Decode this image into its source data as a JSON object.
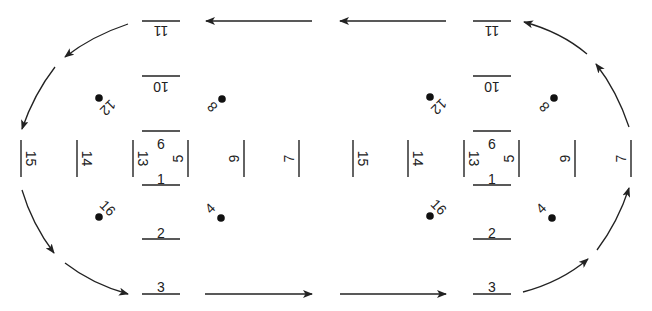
{
  "diagram": {
    "title": "",
    "colors": {
      "stroke": "#222222",
      "dot": "#111111",
      "background": "#ffffff"
    },
    "clusters": [
      {
        "id": "left",
        "cx": 161,
        "hlines": [
          {
            "label": "11",
            "x": 142,
            "y": 21,
            "w": 38,
            "label_y": 30,
            "flipped": true
          },
          {
            "label": "10",
            "x": 142,
            "y": 76,
            "w": 38,
            "label_y": 86,
            "flipped": true
          },
          {
            "label": "6",
            "x": 142,
            "y": 131,
            "w": 38,
            "label_y": 145,
            "flipped": false
          },
          {
            "label": "1",
            "x": 142,
            "y": 185,
            "w": 38,
            "label_y": 180,
            "flipped": false
          },
          {
            "label": "2",
            "x": 142,
            "y": 239,
            "w": 38,
            "label_y": 234,
            "flipped": false
          },
          {
            "label": "3",
            "x": 142,
            "y": 294,
            "w": 38,
            "label_y": 288,
            "flipped": false
          }
        ],
        "vlines": [
          {
            "label": "15",
            "x": 21,
            "y1": 140,
            "y2": 177,
            "side": "right"
          },
          {
            "label": "14",
            "x": 77,
            "y1": 140,
            "y2": 177,
            "side": "right"
          },
          {
            "label": "13",
            "x": 133,
            "y1": 140,
            "y2": 177,
            "side": "right"
          },
          {
            "label": "5",
            "x": 188,
            "y1": 140,
            "y2": 177,
            "side": "left"
          },
          {
            "label": "9",
            "x": 244,
            "y1": 140,
            "y2": 177,
            "side": "left"
          },
          {
            "label": "7",
            "x": 299,
            "y1": 140,
            "y2": 177,
            "side": "left"
          }
        ],
        "dots": [
          {
            "label": "12",
            "x": 99,
            "y": 98,
            "lx": 107,
            "ly": 107,
            "rot": 135
          },
          {
            "label": "8",
            "x": 222,
            "y": 99,
            "lx": 213,
            "ly": 106,
            "rot": 225
          },
          {
            "label": "16",
            "x": 99,
            "y": 217,
            "lx": 107,
            "ly": 209,
            "rot": 45
          },
          {
            "label": "4",
            "x": 221,
            "y": 218,
            "lx": 211,
            "ly": 209,
            "rot": -45
          }
        ]
      },
      {
        "id": "right",
        "cx": 492,
        "hlines": [
          {
            "label": "11",
            "x": 473,
            "y": 21,
            "w": 38,
            "label_y": 30,
            "flipped": true
          },
          {
            "label": "10",
            "x": 473,
            "y": 76,
            "w": 38,
            "label_y": 86,
            "flipped": true
          },
          {
            "label": "6",
            "x": 473,
            "y": 131,
            "w": 38,
            "label_y": 145,
            "flipped": false
          },
          {
            "label": "1",
            "x": 473,
            "y": 185,
            "w": 38,
            "label_y": 180,
            "flipped": false
          },
          {
            "label": "2",
            "x": 473,
            "y": 239,
            "w": 38,
            "label_y": 234,
            "flipped": false
          },
          {
            "label": "3",
            "x": 473,
            "y": 294,
            "w": 38,
            "label_y": 288,
            "flipped": false
          }
        ],
        "vlines": [
          {
            "label": "15",
            "x": 353,
            "y1": 140,
            "y2": 177,
            "side": "right"
          },
          {
            "label": "14",
            "x": 408,
            "y1": 140,
            "y2": 177,
            "side": "right"
          },
          {
            "label": "13",
            "x": 464,
            "y1": 140,
            "y2": 177,
            "side": "right"
          },
          {
            "label": "5",
            "x": 519,
            "y1": 140,
            "y2": 177,
            "side": "left"
          },
          {
            "label": "9",
            "x": 575,
            "y1": 140,
            "y2": 177,
            "side": "left"
          },
          {
            "label": "7",
            "x": 631,
            "y1": 140,
            "y2": 177,
            "side": "left"
          }
        ],
        "dots": [
          {
            "label": "12",
            "x": 430,
            "y": 97,
            "lx": 438,
            "ly": 106,
            "rot": 135
          },
          {
            "label": "8",
            "x": 554,
            "y": 98,
            "lx": 545,
            "ly": 106,
            "rot": 225
          },
          {
            "label": "16",
            "x": 430,
            "y": 216,
            "lx": 438,
            "ly": 208,
            "rot": 45
          },
          {
            "label": "4",
            "x": 552,
            "y": 218,
            "lx": 542,
            "ly": 209,
            "rot": -45
          }
        ]
      }
    ],
    "arrows": [
      {
        "id": "top-left-straight",
        "d": "M 312 21 L 206 21"
      },
      {
        "id": "top-right-straight",
        "d": "M 446 21 L 340 21"
      },
      {
        "id": "bottom-left-straight",
        "d": "M 205 294 L 312 294"
      },
      {
        "id": "bottom-right-straight",
        "d": "M 340 294 L 446 294"
      },
      {
        "id": "upper-left-curve-a",
        "d": "M 128 24 Q 92 36 65 57"
      },
      {
        "id": "upper-left-curve-b",
        "d": "M 55 67 Q 34 94 22 129"
      },
      {
        "id": "lower-left-curve-a",
        "d": "M 22 190 Q 32 224 54 253"
      },
      {
        "id": "lower-left-curve-b",
        "d": "M 65 263 Q 92 284 128 294"
      },
      {
        "id": "upper-right-curve-a",
        "d": "M 587 54 Q 561 32 524 22"
      },
      {
        "id": "upper-right-curve-b",
        "d": "M 629 127 Q 617 91 596 64"
      },
      {
        "id": "lower-right-curve-a",
        "d": "M 523 292 Q 561 282 588 259"
      },
      {
        "id": "lower-right-curve-b",
        "d": "M 597 250 Q 618 222 629 188"
      }
    ]
  }
}
